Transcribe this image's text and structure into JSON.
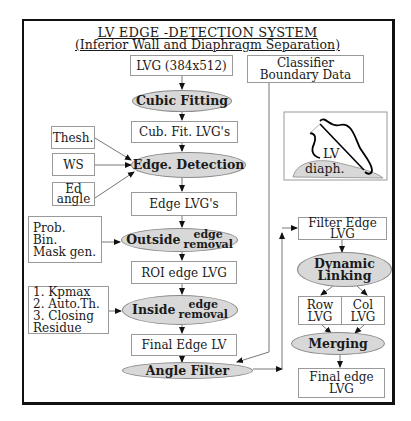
{
  "title": {
    "main": "LV EDGE -DETECTION SYSTEM",
    "subtitle": "(Inferior Wall and Diaphragm Separation)"
  },
  "main_flow": {
    "input": "LVG (384x512)",
    "cubic_fitting": "Cubic Fitting",
    "cub_fit_lvgs": "Cub. Fit. LVG's",
    "edge_detection": "Edge. Detection",
    "edge_lvgs": "Edge LVG's",
    "outside_removal": {
      "prefix": "Outside",
      "top": "edge",
      "bottom": "removal"
    },
    "roi_edge_lvg": "ROI edge LVG",
    "inside_removal": {
      "prefix": "Inside",
      "top": "edge",
      "bottom": "removal"
    },
    "final_edge_lv": "Final Edge LV",
    "angle_filter": "Angle Filter"
  },
  "side_inputs": {
    "thresh": "Thesh.",
    "ws": "WS",
    "ed_angle": "Ed\nangle",
    "prob_bin_mask": "Prob.\nBin.\nMask gen.",
    "kpmax_list": "1. Kpmax\n2. Auto.Th.\n3. Closing\nResidue"
  },
  "classifier": {
    "label": "Classifier\nBoundary Data"
  },
  "inset": {
    "lv_label": "LV",
    "diaph_label": "diaph.",
    "diaph_color": "#d8d8d8"
  },
  "right_flow": {
    "filter_edge_lvg": "Filter Edge\nLVG",
    "dynamic_linking": "Dynamic\nLinking",
    "row_lvg": "Row\nLVG",
    "col_lvg": "Col\nLVG",
    "merging": "Merging",
    "final_edge_lvg": "Final edge\nLVG"
  },
  "colors": {
    "ellipse_fill": "#d8d8d8",
    "box_border": "#9a9a9a",
    "frame": "#111111"
  }
}
